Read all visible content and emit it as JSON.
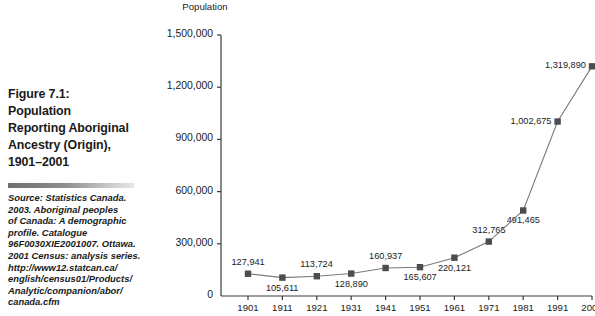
{
  "figure": {
    "title": "Figure 7.1: Population Reporting Aboriginal Ancestry (Origin), 1901–2001",
    "title_lines": [
      "Figure 7.1:",
      "Population",
      "Reporting Aboriginal",
      "Ancestry (Origin),",
      "1901–2001"
    ],
    "source_lines": [
      "Source: Statistics Canada.",
      "2003. Aboriginal peoples",
      "of Canada: A demographic",
      "profile. Catalogue",
      "96F0030XIE2001007. Ottawa.",
      "2001 Census: analysis series.",
      "http://www12.statcan.ca/",
      "english/census01/Products/",
      "Analytic/companion/abor/",
      "canada.cfm"
    ]
  },
  "colors": {
    "marker": "#4d4d4d",
    "line": "#7a7a7a",
    "axis": "#3a3a3a",
    "text": "#1a1a1a"
  },
  "chart_data": {
    "type": "line",
    "title": "",
    "xlabel": "",
    "ylabel": "Population",
    "ylim": [
      0,
      1500000
    ],
    "xlim": [
      1901,
      2001
    ],
    "grid": false,
    "legend": "none",
    "ytick_labels": [
      "0",
      "300,000",
      "600,000",
      "900,000",
      "1,200,000",
      "1,500,000"
    ],
    "ytick_values": [
      0,
      300000,
      600000,
      900000,
      1200000,
      1500000
    ],
    "categories": [
      "1901",
      "1911",
      "1921",
      "1931",
      "1941",
      "1951",
      "1961",
      "1971",
      "1981",
      "1991",
      "2001"
    ],
    "x": [
      1901,
      1911,
      1921,
      1931,
      1941,
      1951,
      1961,
      1971,
      1981,
      1991,
      2001
    ],
    "values": [
      127941,
      105611,
      113724,
      128890,
      160937,
      165607,
      220121,
      312765,
      491465,
      1002675,
      1319890
    ],
    "point_labels": [
      "127,941",
      "105,611",
      "113,724",
      "128,890",
      "160,937",
      "165,607",
      "220,121",
      "312,765",
      "491,465",
      "1,002,675",
      "1,319,890"
    ],
    "point_label_position": [
      "above",
      "below",
      "above",
      "below",
      "above",
      "below",
      "below",
      "above",
      "below",
      "left",
      "left"
    ],
    "series": [
      {
        "name": "Population Reporting Aboriginal Ancestry",
        "values": [
          127941,
          105611,
          113724,
          128890,
          160937,
          165607,
          220121,
          312765,
          491465,
          1002675,
          1319890
        ]
      }
    ]
  }
}
